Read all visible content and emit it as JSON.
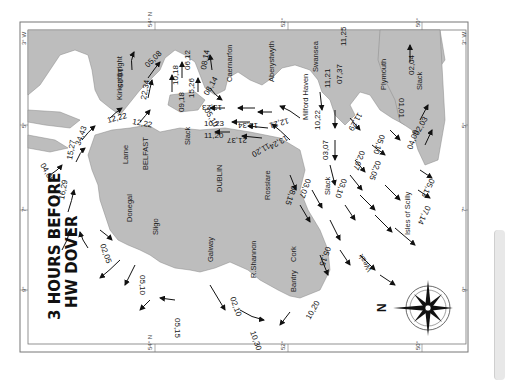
{
  "map": {
    "title_line1": "3 HOURS BEFORE",
    "title_line2": "HW DOVER",
    "orientation": "rotated 90 degrees; north points left",
    "compass_label": "N",
    "colors": {
      "land": "#bdbdbd",
      "sea": "#ffffff",
      "frame": "#6e6e6e",
      "text": "#1a1a1a"
    },
    "frame_ticks": {
      "top": [
        "54° N",
        "52°",
        "50°"
      ],
      "bottom": [
        "54° N",
        "52°",
        "50°"
      ],
      "left": [
        "3° W",
        "5°",
        "7°",
        "9°"
      ],
      "right": [
        "3° W",
        "5°",
        "7°",
        "9°"
      ]
    },
    "places": [
      "Kirkcudbright",
      "Caernarfon",
      "Aberystwyth",
      "Swansea",
      "Milford Haven",
      "Plymouth",
      "Larne",
      "BELFAST",
      "DUBLIN",
      "Rosslare",
      "Donegal",
      "Sligo",
      "Galway",
      "R.Shannon",
      "Cork",
      "Bantry",
      "Isles of Scilly"
    ],
    "slack_labels": [
      "Slack",
      "Slack",
      "Slack",
      "Weak"
    ],
    "stream_rates": [
      "16,29",
      "05,08",
      "22,34",
      "10,18",
      "06,12",
      "15,26",
      "08,14",
      "08,14",
      "09,18",
      "12,22",
      "12,22",
      "05,10",
      "13,23",
      "10,23",
      "18,34",
      "11,20",
      "21,37",
      "12,21",
      "13,24",
      "11,20",
      "11,25",
      "07,37",
      "11,21",
      "11,29",
      "10,22",
      "03,07",
      "02,07",
      "05,10",
      "02,04",
      "01,01",
      "02,03",
      "04,09",
      "05,13",
      "07,14",
      "02,05",
      "03,10",
      "08,15",
      "03,07",
      "05,15",
      "04,08",
      "15,27",
      "34,43",
      "16,29",
      "02,05",
      "05,10",
      "05,15",
      "02,10",
      "10,20",
      "10,30"
    ]
  }
}
